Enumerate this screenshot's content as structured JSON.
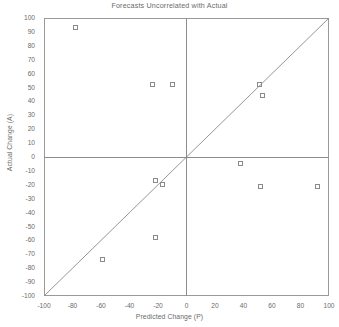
{
  "chart_data": {
    "type": "scatter",
    "title": "Forecasts Uncorrelated with Actual",
    "xlabel": "Predicted Change (P)",
    "ylabel": "Actual Change (A)",
    "xlim": [
      -100,
      100
    ],
    "ylim": [
      -100,
      100
    ],
    "xticks": [
      -100,
      -80,
      -60,
      -40,
      -20,
      0,
      20,
      40,
      60,
      80,
      100
    ],
    "xticks_minor": [
      -90,
      -70,
      -50,
      -30,
      -10,
      10,
      30,
      50,
      70,
      90
    ],
    "yticks": [
      100,
      90,
      80,
      70,
      60,
      50,
      40,
      30,
      20,
      10,
      0,
      -10,
      -20,
      -30,
      -40,
      -50,
      -60,
      -70,
      -80,
      -90,
      -100
    ],
    "grid": false,
    "legend": null,
    "reference_line": {
      "name": "identity-line",
      "from": [
        -100,
        -100
      ],
      "to": [
        100,
        100
      ]
    },
    "marker": "open-square",
    "marker_color": "#8a8a8a",
    "points": [
      {
        "x": -78,
        "y": 93
      },
      {
        "x": -24,
        "y": 52
      },
      {
        "x": -10,
        "y": 52
      },
      {
        "x": -22,
        "y": -17
      },
      {
        "x": -17,
        "y": -20
      },
      {
        "x": -22,
        "y": -58
      },
      {
        "x": -59,
        "y": -74
      },
      {
        "x": 51,
        "y": 52
      },
      {
        "x": 53,
        "y": 44
      },
      {
        "x": 38,
        "y": -5
      },
      {
        "x": 52,
        "y": -21
      },
      {
        "x": 92,
        "y": -21
      }
    ]
  }
}
